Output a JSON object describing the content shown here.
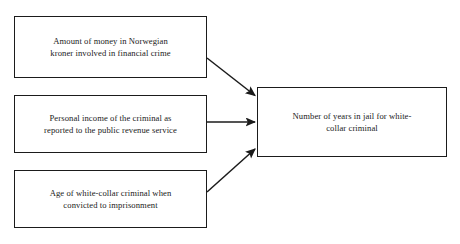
{
  "diagram": {
    "type": "causal-model-diagram",
    "orientation": "left-to-right",
    "background_color": "#ffffff",
    "line_color": "#1b1b1b",
    "independent_variables": [
      {
        "id": "money",
        "label": "Amount of money in Norwegian\nkroner involved in financial crime",
        "role": "independent-variable"
      },
      {
        "id": "income",
        "label": "Personal income of the criminal as\nreported to the public revenue service",
        "role": "independent-variable"
      },
      {
        "id": "age",
        "label": "Age of white-collar criminal when\nconvicted to imprisonment",
        "role": "independent-variable"
      }
    ],
    "dependent_variable": {
      "id": "jail-years",
      "label": "Number of years in jail for white-\ncollar criminal",
      "role": "dependent-variable"
    },
    "connections": [
      {
        "from": "money",
        "to": "jail-years",
        "style": "arrow",
        "direction": "down-right"
      },
      {
        "from": "income",
        "to": "jail-years",
        "style": "arrow",
        "direction": "horizontal"
      },
      {
        "from": "age",
        "to": "jail-years",
        "style": "arrow",
        "direction": "up-right"
      }
    ]
  }
}
